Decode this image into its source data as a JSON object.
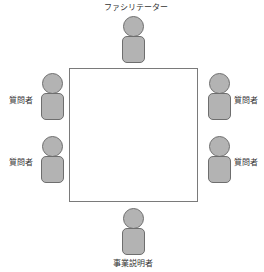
{
  "diagram": {
    "table": {
      "shape": "square",
      "border_color": "#7a7a7a"
    },
    "colors": {
      "person_fill": "#b3b3b3",
      "person_stroke": "#6e6e6e",
      "text": "#333333"
    },
    "participants": [
      {
        "position": "top",
        "label": "ファシリテーター"
      },
      {
        "position": "left-upper",
        "label": "質問者"
      },
      {
        "position": "left-lower",
        "label": "質問者"
      },
      {
        "position": "right-upper",
        "label": "質問者"
      },
      {
        "position": "right-lower",
        "label": "質問者"
      },
      {
        "position": "bottom",
        "label": "事業説明者"
      }
    ]
  }
}
